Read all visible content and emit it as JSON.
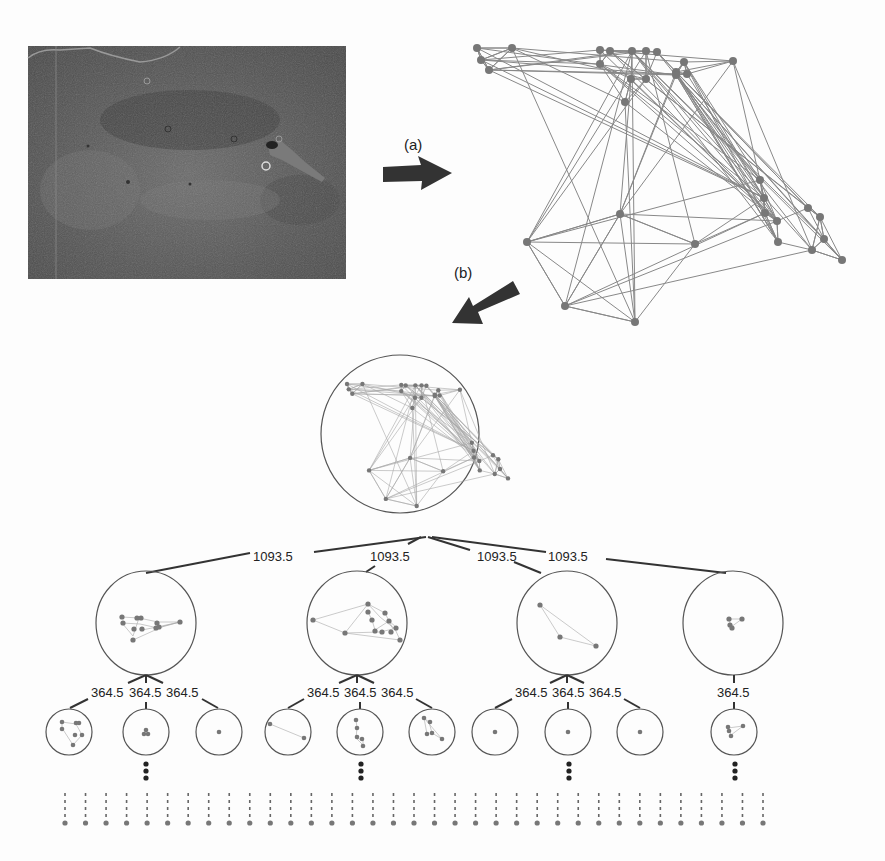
{
  "figure": {
    "microscopy_image": {
      "label": "cell-microscopy-image"
    },
    "arrows": [
      {
        "id": "a",
        "label": "(a)"
      },
      {
        "id": "b",
        "label": "(b)"
      }
    ],
    "graph": {
      "nodes": [
        [
          477,
          48
        ],
        [
          512,
          48
        ],
        [
          600,
          50
        ],
        [
          610,
          51
        ],
        [
          632,
          51
        ],
        [
          646,
          51
        ],
        [
          657,
          52
        ],
        [
          684,
          62
        ],
        [
          733,
          61
        ],
        [
          481,
          60
        ],
        [
          489,
          70
        ],
        [
          600,
          64
        ],
        [
          631,
          79
        ],
        [
          646,
          79
        ],
        [
          676,
          72
        ],
        [
          687,
          74
        ],
        [
          676,
          75
        ],
        [
          625,
          102
        ],
        [
          527,
          242
        ],
        [
          620,
          214
        ],
        [
          695,
          244
        ],
        [
          565,
          306
        ],
        [
          635,
          322
        ],
        [
          760,
          180
        ],
        [
          764,
          198
        ],
        [
          765,
          213
        ],
        [
          777,
          221
        ],
        [
          778,
          242
        ],
        [
          812,
          250
        ],
        [
          820,
          217
        ],
        [
          808,
          208
        ],
        [
          824,
          239
        ],
        [
          842,
          260
        ]
      ]
    },
    "tree": {
      "level1_edges": [
        {
          "label": "1093.5"
        },
        {
          "label": "1093.5"
        },
        {
          "label": "1093.5"
        },
        {
          "label": "1093.5"
        }
      ],
      "level2_groups": [
        {
          "edges": [
            {
              "label": "364.5"
            },
            {
              "label": "364.5"
            },
            {
              "label": "364.5"
            }
          ]
        },
        {
          "edges": [
            {
              "label": "364.5"
            },
            {
              "label": "364.5"
            },
            {
              "label": "364.5"
            }
          ]
        },
        {
          "edges": [
            {
              "label": "364.5"
            },
            {
              "label": "364.5"
            },
            {
              "label": "364.5"
            }
          ]
        },
        {
          "edges": [
            {
              "label": "364.5"
            }
          ]
        }
      ],
      "continuation_marker": "⋮",
      "leaf_count": 35
    },
    "colors": {
      "node": "#777777",
      "edge": "#888888",
      "tree_line": "#333333",
      "arrow": "#333333"
    }
  }
}
